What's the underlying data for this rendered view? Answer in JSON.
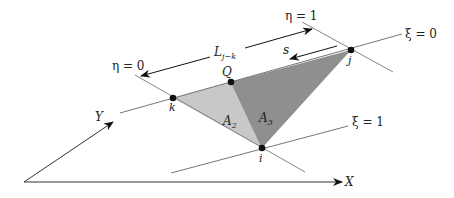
{
  "diagram": {
    "colors": {
      "light_triangle": "#c8c8c8",
      "dark_triangle": "#8f8f8f",
      "line": "#555555",
      "dark": "#111111"
    },
    "labels": {
      "eta0": "η = 0",
      "eta1": "η = 1",
      "xi0": "ξ = 0",
      "xi1": "ξ = 1",
      "L": "L",
      "L_sub": "j−k",
      "s": "s",
      "Q": "Q",
      "j": "j",
      "k": "k",
      "i": "i",
      "A2": "A",
      "A2_sub": "2",
      "A3": "A",
      "A3_sub": "3",
      "X": "X",
      "Y": "Y"
    },
    "nodes": [
      {
        "name": "k",
        "x": 173,
        "y": 98
      },
      {
        "name": "Q",
        "x": 231,
        "y": 82
      },
      {
        "name": "j",
        "x": 351,
        "y": 50
      },
      {
        "name": "i",
        "x": 262,
        "y": 148
      }
    ]
  }
}
